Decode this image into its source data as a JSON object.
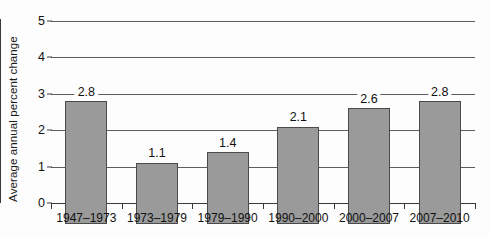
{
  "chart_data": {
    "type": "bar",
    "title": "",
    "xlabel": "",
    "ylabel": "Average annual percent change",
    "categories": [
      "1947–1973",
      "1973–1979",
      "1979–1990",
      "1990–2000",
      "2000–2007",
      "2007–2010"
    ],
    "values": [
      2.8,
      1.1,
      1.4,
      2.1,
      2.6,
      2.8
    ],
    "value_labels": [
      "2.8",
      "1.1",
      "1.4",
      "2.1",
      "2.6",
      "2.8"
    ],
    "ylim": [
      0,
      5
    ],
    "ytick_labels": [
      "0",
      "1",
      "2",
      "3",
      "4",
      "5"
    ],
    "ytick_values": [
      0,
      1,
      2,
      3,
      4,
      5
    ],
    "grid": true,
    "legend": "none",
    "colors": {
      "bar_fill": "#9a9a9a",
      "bar_stroke": "#4a4a4a",
      "gridline": "#5d5d5d",
      "axis": "#3a3a3a",
      "text": "#111111",
      "background": "#fdfdfd"
    }
  }
}
